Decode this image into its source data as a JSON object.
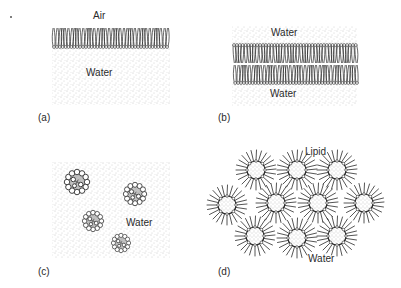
{
  "figure": {
    "panels": [
      {
        "id": "a",
        "panel_label": "(a)",
        "description": "Lipid monolayer at air-water interface",
        "labels": {
          "top": "Air",
          "bottom": "Water"
        }
      },
      {
        "id": "b",
        "panel_label": "(b)",
        "description": "Lipid bilayer between water phases",
        "labels": {
          "top": "Water",
          "bottom": "Water"
        }
      },
      {
        "id": "c",
        "panel_label": "(c)",
        "description": "Micelles dispersed in water",
        "labels": {
          "medium": "Water"
        },
        "micelle_count": 4
      },
      {
        "id": "d",
        "panel_label": "(d)",
        "description": "Reverse micelles in lipid",
        "labels": {
          "top": "Lipid",
          "bottom": "Water"
        },
        "micelle_count": 10
      }
    ],
    "colors": {
      "ink": "#2a2a2a",
      "stipple": "#9a9a9a",
      "background": "#ffffff"
    }
  }
}
